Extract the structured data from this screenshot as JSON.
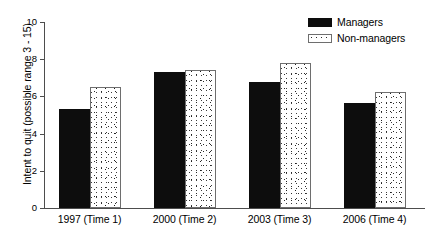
{
  "chart_data": {
    "type": "bar",
    "title": "",
    "subtitle": "",
    "xlabel": "",
    "ylabel": "Intent to quit (possible range 3 - 15)",
    "categories": [
      "1997 (Time 1)",
      "2000 (Time 2)",
      "2003 (Time 3)",
      "2006 (Time 4)"
    ],
    "series": [
      {
        "name": "Managers",
        "fill": "solid-black",
        "color": "#0d0d0d",
        "values": [
          5.3,
          7.3,
          6.75,
          5.65
        ]
      },
      {
        "name": "Non-managers",
        "fill": "white-stipple",
        "color": "#ffffff",
        "values": [
          6.5,
          7.4,
          7.8,
          6.25
        ]
      }
    ],
    "ylim": [
      0,
      10
    ],
    "yticks": [
      0,
      2,
      4,
      6,
      8,
      10
    ],
    "ytick_labels": [
      "0",
      "2",
      "4",
      "6",
      "8",
      "10"
    ],
    "grid": false,
    "legend_position": "top-right",
    "legend_entries": [
      "Managers",
      "Non-managers"
    ]
  }
}
